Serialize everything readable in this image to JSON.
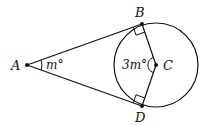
{
  "diagram": {
    "points": {
      "A": {
        "label": "A",
        "x": 27,
        "y": 65
      },
      "B": {
        "label": "B",
        "x": 142,
        "y": 24
      },
      "C": {
        "label": "C",
        "x": 156,
        "y": 65
      },
      "D": {
        "label": "D",
        "x": 142,
        "y": 106
      }
    },
    "circle": {
      "center": "C",
      "radius": 42
    },
    "angle_labels": {
      "A": "m°",
      "C": "3m°"
    },
    "right_angles": [
      "B",
      "D"
    ],
    "colors": {
      "stroke": "#111111",
      "background": "#ffffff"
    }
  }
}
